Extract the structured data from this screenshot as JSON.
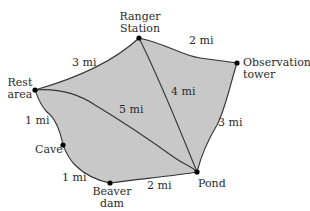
{
  "diagram": {
    "fill_color": "#c8c8c8",
    "line_color": "#333333",
    "nodes": [
      {
        "id": "ranger",
        "label_line1": "Ranger",
        "label_line2": "Station",
        "x": 139,
        "y": 38
      },
      {
        "id": "tower",
        "label_line1": "Observation",
        "label_line2": "tower",
        "x": 237,
        "y": 63
      },
      {
        "id": "rest",
        "label_line1": "Rest",
        "label_line2": "area",
        "x": 35,
        "y": 90
      },
      {
        "id": "cave",
        "label_line1": "Cave",
        "x": 63,
        "y": 145
      },
      {
        "id": "beaver",
        "label_line1": "Beaver",
        "label_line2": "dam",
        "x": 110,
        "y": 183
      },
      {
        "id": "pond",
        "label_line1": "Pond",
        "x": 197,
        "y": 172
      }
    ],
    "edges": [
      {
        "from": "rest",
        "to": "ranger",
        "label": "3 mi"
      },
      {
        "from": "ranger",
        "to": "tower",
        "label": "2 mi"
      },
      {
        "from": "tower",
        "to": "pond",
        "label": "3 mi"
      },
      {
        "from": "ranger",
        "to": "pond",
        "label": "4 mi"
      },
      {
        "from": "rest",
        "to": "pond",
        "label": "5 mi"
      },
      {
        "from": "rest",
        "to": "cave",
        "label": "1 mi"
      },
      {
        "from": "cave",
        "to": "beaver",
        "label": "1 mi"
      },
      {
        "from": "beaver",
        "to": "pond",
        "label": "2 mi"
      }
    ]
  }
}
